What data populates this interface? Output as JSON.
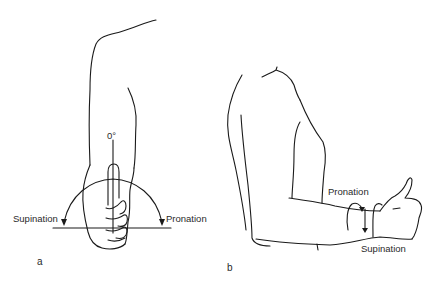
{
  "figure": {
    "panel_a": {
      "letter": "a",
      "angle_label": "0°",
      "left_label": "Supination",
      "right_label": "Pronation"
    },
    "panel_b": {
      "letter": "b",
      "top_label": "Pronation",
      "bottom_label": "Supination"
    },
    "stroke_color": "#1a1a1a",
    "background": "#ffffff"
  }
}
